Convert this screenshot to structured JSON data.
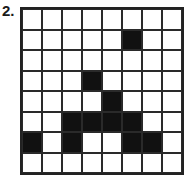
{
  "label": "2.",
  "grid": {
    "rows": 8,
    "cols": 8,
    "fill_color": "#111111",
    "empty_color": "#ffffff",
    "cells": [
      [
        0,
        0,
        0,
        0,
        0,
        0,
        0,
        0
      ],
      [
        0,
        0,
        0,
        0,
        0,
        1,
        0,
        0
      ],
      [
        0,
        0,
        0,
        0,
        0,
        0,
        0,
        0
      ],
      [
        0,
        0,
        0,
        1,
        0,
        0,
        0,
        0
      ],
      [
        0,
        0,
        0,
        0,
        1,
        0,
        0,
        0
      ],
      [
        0,
        0,
        1,
        1,
        1,
        1,
        0,
        0
      ],
      [
        1,
        0,
        1,
        0,
        0,
        1,
        1,
        0
      ],
      [
        0,
        0,
        0,
        0,
        0,
        0,
        0,
        0
      ]
    ]
  }
}
